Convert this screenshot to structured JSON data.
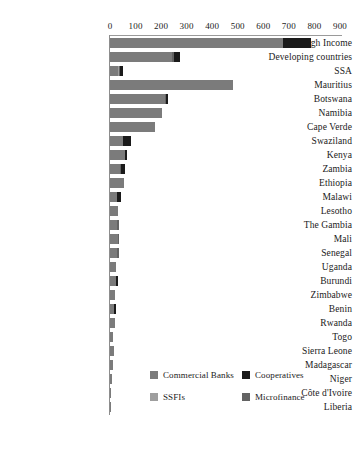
{
  "chart_data": {
    "type": "bar",
    "orientation": "horizontal",
    "stacked": true,
    "title": "",
    "subtitle": "",
    "xlabel": "",
    "ylabel": "",
    "xlim": [
      0,
      900
    ],
    "xticks": [
      0,
      100,
      200,
      300,
      400,
      500,
      600,
      700,
      800,
      900
    ],
    "xtick_labels": [
      "0",
      "100",
      "200",
      "300",
      "400",
      "500",
      "600",
      "700",
      "800",
      "900"
    ],
    "grid": false,
    "legend_position": "bottom-right",
    "categories": [
      "High Income",
      "Developing countries",
      "SSA",
      "Mauritius",
      "Botswana",
      "Namibia",
      "Cape Verde",
      "Swaziland",
      "Kenya",
      "Zambia",
      "Ethiopia",
      "Malawi",
      "Lesotho",
      "The Gambia",
      "Mali",
      "Senegal",
      "Uganda",
      "Burundi",
      "Zimbabwe",
      "Benin",
      "Rwanda",
      "Togo",
      "Sierra Leone",
      "Madagascar",
      "Niger",
      "Côte d'Ivoire",
      "Liberia"
    ],
    "series": [
      {
        "name": "Commercial Banks",
        "color": "#7b7b7b",
        "values": [
          675,
          243,
          30,
          482,
          215,
          205,
          176,
          52,
          58,
          40,
          55,
          28,
          33,
          28,
          30,
          26,
          24,
          22,
          20,
          14,
          18,
          12,
          16,
          10,
          6,
          4,
          2
        ]
      },
      {
        "name": "SSFIs",
        "color": "#9e9e9e",
        "values": [
          0,
          0,
          4,
          0,
          0,
          0,
          0,
          0,
          0,
          0,
          0,
          0,
          0,
          0,
          0,
          0,
          0,
          0,
          0,
          0,
          0,
          0,
          0,
          0,
          0,
          0,
          0
        ]
      },
      {
        "name": "Microfinance",
        "color": "#636363",
        "values": [
          0,
          6,
          4,
          0,
          5,
          0,
          0,
          0,
          0,
          5,
          0,
          0,
          0,
          6,
          6,
          8,
          0,
          0,
          0,
          0,
          0,
          0,
          0,
          0,
          0,
          0,
          0
        ]
      },
      {
        "name": "Cooperatives",
        "color": "#1a1a1a",
        "values": [
          113,
          24,
          12,
          0,
          6,
          0,
          0,
          30,
          10,
          14,
          0,
          14,
          0,
          0,
          0,
          0,
          0,
          10,
          0,
          10,
          0,
          0,
          0,
          0,
          0,
          0,
          0
        ]
      }
    ],
    "bar_totals": [
      788,
      273,
      50,
      482,
      226,
      205,
      176,
      82,
      68,
      59,
      55,
      42,
      33,
      34,
      36,
      34,
      24,
      32,
      20,
      24,
      18,
      12,
      16,
      10,
      6,
      4,
      2
    ],
    "legend": [
      {
        "label": "Commercial Banks",
        "color": "#7b7b7b"
      },
      {
        "label": "Cooperatives",
        "color": "#1a1a1a"
      },
      {
        "label": "SSFIs",
        "color": "#9e9e9e"
      },
      {
        "label": "Microfinance",
        "color": "#636363"
      }
    ]
  },
  "colors": {
    "background": "#ffffff",
    "axis": "#9a9a9a",
    "text": "#1a1a1a"
  }
}
